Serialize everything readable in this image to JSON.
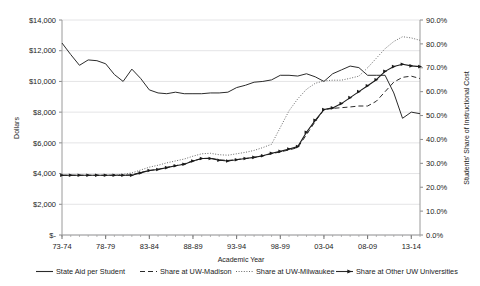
{
  "chart_data": {
    "type": "line",
    "title": "",
    "xlabel": "Academic Year",
    "ylabel": "Dollars",
    "y2label": "Students' Share of Instructional Cost",
    "grid": true,
    "legend_position": "bottom",
    "ylim": [
      0,
      14000
    ],
    "y2lim": [
      0,
      0.9
    ],
    "y_ticks": [
      "$-",
      "$2,000",
      "$4,000",
      "$6,000",
      "$8,000",
      "$10,000",
      "$12,000",
      "$14,000"
    ],
    "y_tick_values": [
      0,
      2000,
      4000,
      6000,
      8000,
      10000,
      12000,
      14000
    ],
    "y2_ticks": [
      "0.0%",
      "10.0%",
      "20.0%",
      "30.0%",
      "40.0%",
      "50.0%",
      "60.0%",
      "70.0%",
      "80.0%",
      "90.0%"
    ],
    "y2_tick_values": [
      0,
      10,
      20,
      30,
      40,
      50,
      60,
      70,
      80,
      90
    ],
    "x_tick_labels": [
      "73-74",
      "78-79",
      "83-84",
      "88-89",
      "93-94",
      "98-99",
      "03-04",
      "08-09",
      "13-14"
    ],
    "x_tick_indices": [
      0,
      5,
      10,
      15,
      20,
      25,
      30,
      35,
      40
    ],
    "categories": [
      "73-74",
      "74-75",
      "75-76",
      "76-77",
      "77-78",
      "78-79",
      "79-80",
      "80-81",
      "81-82",
      "82-83",
      "83-84",
      "84-85",
      "85-86",
      "86-87",
      "87-88",
      "88-89",
      "89-90",
      "90-91",
      "91-92",
      "92-93",
      "93-94",
      "94-95",
      "95-96",
      "96-97",
      "97-98",
      "98-99",
      "99-00",
      "00-01",
      "01-02",
      "02-03",
      "03-04",
      "04-05",
      "05-06",
      "06-07",
      "07-08",
      "08-09",
      "09-10",
      "10-11",
      "11-12",
      "12-13",
      "13-14",
      "14-15"
    ],
    "series": [
      {
        "name": "State Aid per Student",
        "axis": "left",
        "unit": "dollars",
        "style": "solid",
        "marker": "none",
        "color": "#2b2b2b",
        "values": [
          12500,
          11750,
          11050,
          11400,
          11350,
          11150,
          10450,
          10000,
          10800,
          10200,
          9450,
          9250,
          9200,
          9300,
          9200,
          9200,
          9200,
          9250,
          9250,
          9300,
          9600,
          9750,
          9950,
          10000,
          10100,
          10400,
          10400,
          10350,
          10500,
          10300,
          10000,
          10500,
          10750,
          11000,
          10900,
          10400,
          10400,
          10400,
          9250,
          7600,
          8000,
          7900
        ]
      },
      {
        "name": "Share at UW-Madison",
        "axis": "right",
        "unit": "percent",
        "style": "dashed",
        "marker": "none",
        "color": "#2b2b2b",
        "values": [
          25.0,
          25.0,
          25.0,
          25.0,
          25.0,
          25.0,
          25.0,
          25.0,
          25.2,
          26.2,
          27.0,
          27.5,
          28.3,
          29.0,
          29.8,
          31.0,
          32.0,
          32.2,
          31.5,
          31.2,
          31.6,
          32.0,
          32.4,
          33.2,
          34.0,
          34.8,
          35.6,
          36.6,
          42.0,
          47.5,
          52.5,
          53.0,
          53.3,
          53.6,
          54.0,
          54.0,
          56.0,
          60.0,
          64.0,
          66.0,
          66.5,
          65.5
        ]
      },
      {
        "name": "Share at UW-Milwaukee",
        "axis": "right",
        "unit": "percent",
        "style": "dotted",
        "marker": "none",
        "color": "#6b6b6b",
        "values": [
          25.0,
          25.0,
          25.0,
          25.0,
          25.0,
          25.0,
          25.2,
          25.4,
          26.0,
          27.2,
          28.4,
          29.2,
          30.2,
          31.0,
          31.8,
          33.0,
          34.0,
          34.2,
          33.6,
          33.4,
          34.0,
          34.6,
          35.4,
          36.6,
          38.0,
          45.0,
          52.0,
          57.0,
          61.0,
          63.5,
          64.5,
          64.8,
          64.8,
          65.6,
          66.5,
          70.0,
          74.0,
          78.0,
          81.0,
          83.0,
          82.5,
          81.5
        ]
      },
      {
        "name": "Share at Other UW Universities",
        "axis": "right",
        "unit": "percent",
        "style": "solid",
        "marker": "triangle",
        "color": "#1b1b1b",
        "values": [
          25.0,
          25.0,
          25.0,
          25.0,
          25.0,
          25.0,
          25.0,
          25.0,
          25.0,
          26.0,
          27.0,
          27.4,
          28.2,
          29.0,
          29.6,
          31.0,
          32.0,
          32.0,
          31.3,
          31.0,
          31.5,
          32.0,
          32.5,
          33.2,
          34.2,
          35.0,
          36.0,
          37.0,
          43.0,
          48.0,
          52.5,
          53.2,
          55.0,
          57.5,
          60.0,
          62.5,
          65.0,
          68.5,
          70.5,
          71.5,
          70.8,
          70.5
        ]
      }
    ]
  },
  "legend": {
    "items": [
      {
        "label": "State Aid per Student",
        "style": "solid",
        "marker": "none"
      },
      {
        "label": "Share at UW-Madison",
        "style": "dashed",
        "marker": "none"
      },
      {
        "label": "Share at UW-Milwaukee",
        "style": "dotted",
        "marker": "none"
      },
      {
        "label": "Share at Other UW Universities",
        "style": "solid",
        "marker": "triangle"
      }
    ]
  }
}
